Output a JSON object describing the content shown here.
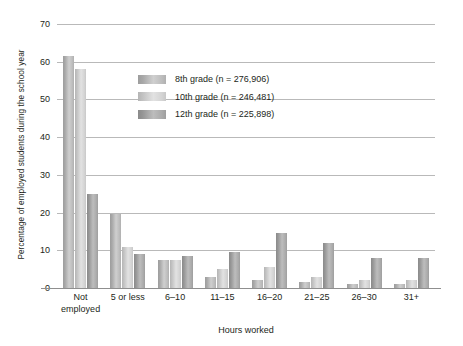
{
  "chart_data": {
    "type": "bar",
    "title": "",
    "xlabel": "Hours worked",
    "ylabel": "Percentage of employed students during the school year",
    "ylim": [
      0,
      70
    ],
    "yticks": [
      0,
      10,
      20,
      30,
      40,
      50,
      60,
      70
    ],
    "grid": true,
    "legend_position": "inset-top-center",
    "categories": [
      "Not\nemployed",
      "5 or less",
      "6–10",
      "11–15",
      "16–20",
      "21–25",
      "26–30",
      "31+"
    ],
    "series": [
      {
        "name": "8th grade (n = 276,906)",
        "values": [
          61.5,
          19.5,
          7.5,
          3.0,
          2.0,
          1.5,
          1.0,
          1.0
        ]
      },
      {
        "name": "10th grade (n = 246,481)",
        "values": [
          58.0,
          11.0,
          7.5,
          5.0,
          5.5,
          3.0,
          2.0,
          2.0
        ]
      },
      {
        "name": "12th grade (n = 225,898)",
        "values": [
          25.0,
          9.0,
          8.5,
          9.5,
          14.5,
          12.0,
          8.0,
          8.0
        ]
      }
    ],
    "colors": [
      "#b9b9b9",
      "#d2d2d2",
      "#a5a5a5"
    ]
  }
}
